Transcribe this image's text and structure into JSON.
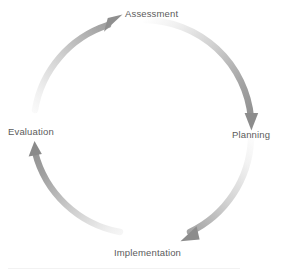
{
  "diagram": {
    "type": "cycle",
    "direction": "clockwise",
    "background_color": "#ffffff",
    "label_color": "#5b5b5b",
    "arrow_color_dark": "#8c8c8c",
    "arrow_color_light": "#fdfdfd",
    "center": {
      "x": 143,
      "y": 128
    },
    "radius": 108,
    "stages": [
      {
        "id": "assessment",
        "label": "Assessment",
        "order": 1,
        "angle_deg": 270,
        "arrow_name": "arrow-evaluation-to-assessment",
        "arrowhead_direction": "up-right"
      },
      {
        "id": "planning",
        "label": "Planning",
        "order": 2,
        "angle_deg": 0,
        "arrow_name": "arrow-assessment-to-planning",
        "arrowhead_direction": "down"
      },
      {
        "id": "implementation",
        "label": "Implementation",
        "order": 3,
        "angle_deg": 90,
        "arrow_name": "arrow-planning-to-implementation",
        "arrowhead_direction": "down-left"
      },
      {
        "id": "evaluation",
        "label": "Evaluation",
        "order": 4,
        "angle_deg": 180,
        "arrow_name": "arrow-implementation-to-evaluation",
        "arrowhead_direction": "up"
      }
    ]
  }
}
